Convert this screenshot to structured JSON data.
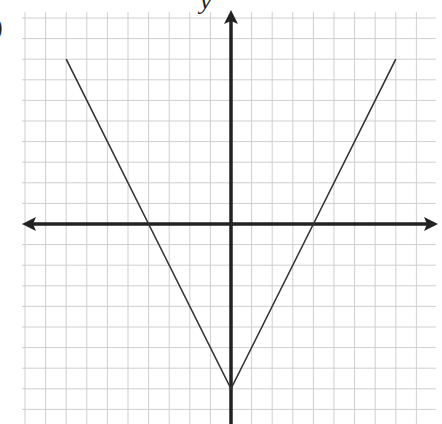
{
  "chart_data": {
    "type": "line",
    "title": "",
    "part_label": ")",
    "xlabel": "",
    "ylabel": "y",
    "function": "y = 2|x| - 8",
    "grid": true,
    "xlim": [
      -10,
      10
    ],
    "ylim": [
      -10,
      10
    ],
    "grid_step": 1,
    "series": [
      {
        "name": "graph",
        "x": [
          -8,
          -4,
          0,
          4,
          8
        ],
        "y": [
          8,
          0,
          -8,
          0,
          8
        ]
      }
    ],
    "vertex": [
      0,
      -8
    ],
    "x_intercepts": [
      -4,
      4
    ],
    "colors": {
      "grid": "#cfcfcf",
      "axes": "#222222",
      "line": "#333333"
    }
  }
}
